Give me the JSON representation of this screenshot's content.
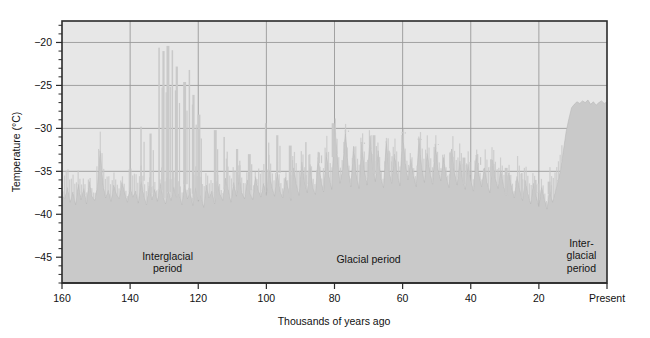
{
  "figure": {
    "background_color": "#ffffff",
    "plot_background_color": "#e7e7e7",
    "series_color": "#c9c9c9",
    "grid_color": "#9a9a9a",
    "frame_color": "#2b2b2b"
  },
  "chart_data": {
    "type": "area",
    "title": "",
    "subtitle": "",
    "xlabel": "Thousands of years ago",
    "ylabel": "Temperature (°C)",
    "xlim": [
      160,
      0
    ],
    "ylim": [
      -48,
      -17.5
    ],
    "x_reversed": true,
    "grid": true,
    "legend": "none",
    "x_tick_values": [
      160,
      140,
      120,
      100,
      80,
      60,
      40,
      20,
      0
    ],
    "x_tick_labels": [
      "160",
      "140",
      "120",
      "100",
      "80",
      "60",
      "40",
      "20",
      "Present"
    ],
    "x_minor_tick_step": 5,
    "y_tick_values": [
      -20,
      -25,
      -30,
      -35,
      -40,
      -45
    ],
    "y_tick_labels": [
      "−20",
      "−25",
      "−30",
      "−35",
      "−40",
      "−45"
    ],
    "y_minor_tick_step": 1,
    "annotations": [
      {
        "name": "interglacial-left",
        "lines": [
          "Interglacial",
          "period"
        ],
        "x": 129,
        "y": -45.3
      },
      {
        "name": "glacial-middle",
        "lines": [
          "Glacial period"
        ],
        "x": 70,
        "y": -45.7
      },
      {
        "name": "interglacial-right",
        "lines": [
          "Inter-",
          "glacial",
          "period"
        ],
        "x": 7.5,
        "y": -43.8
      }
    ],
    "series": [
      {
        "name": "Ice-core temperature reconstruction",
        "units": "°C",
        "x": [
          160.0,
          159.2,
          158.4,
          157.6,
          156.8,
          156.0,
          155.2,
          154.4,
          153.6,
          152.8,
          152.0,
          151.2,
          150.4,
          149.6,
          148.8,
          148.0,
          147.2,
          146.4,
          145.6,
          144.8,
          144.0,
          143.2,
          142.4,
          141.6,
          140.8,
          140.0,
          139.2,
          138.4,
          137.6,
          136.8,
          136.0,
          135.2,
          134.4,
          133.6,
          132.8,
          132.0,
          131.2,
          130.4,
          129.6,
          128.8,
          128.0,
          127.2,
          126.4,
          125.6,
          124.8,
          124.0,
          123.2,
          122.4,
          121.6,
          120.8,
          120.0,
          119.2,
          118.4,
          117.6,
          116.8,
          116.0,
          115.2,
          114.4,
          113.6,
          112.8,
          112.0,
          111.2,
          110.4,
          109.6,
          108.8,
          108.0,
          107.2,
          106.4,
          105.6,
          104.8,
          104.0,
          103.2,
          102.4,
          101.6,
          100.8,
          100.0,
          99.2,
          98.4,
          97.6,
          96.8,
          96.0,
          95.2,
          94.4,
          93.6,
          92.8,
          92.0,
          91.2,
          90.4,
          89.6,
          88.8,
          88.0,
          87.2,
          86.4,
          85.6,
          84.8,
          84.0,
          83.2,
          82.4,
          81.6,
          80.8,
          80.0,
          79.2,
          78.4,
          77.6,
          76.8,
          76.0,
          75.2,
          74.4,
          73.6,
          72.8,
          72.0,
          71.2,
          70.4,
          69.6,
          68.8,
          68.0,
          67.2,
          66.4,
          65.6,
          64.8,
          64.0,
          63.2,
          62.4,
          61.6,
          60.8,
          60.0,
          59.2,
          58.4,
          57.6,
          56.8,
          56.0,
          55.2,
          54.4,
          53.6,
          52.8,
          52.0,
          51.2,
          50.4,
          49.6,
          48.8,
          48.0,
          47.2,
          46.4,
          45.6,
          44.8,
          44.0,
          43.2,
          42.4,
          41.6,
          40.8,
          40.0,
          39.2,
          38.4,
          37.6,
          36.8,
          36.0,
          35.2,
          34.4,
          33.6,
          32.8,
          32.0,
          31.2,
          30.4,
          29.6,
          28.8,
          28.0,
          27.2,
          26.4,
          25.6,
          24.8,
          24.0,
          23.2,
          22.4,
          21.6,
          20.8,
          20.0,
          19.2,
          18.4,
          17.6,
          16.8,
          16.0,
          15.2,
          14.4,
          13.6,
          12.8,
          12.0,
          11.2,
          10.4,
          9.6,
          8.8,
          8.0,
          7.2,
          6.4,
          5.6,
          4.8,
          4.0,
          3.2,
          2.4,
          1.6,
          0.8,
          0.0
        ],
        "y": [
          -37.8,
          -38.2,
          -36.9,
          -38.6,
          -37.4,
          -38.9,
          -36.5,
          -38.3,
          -37.0,
          -38.8,
          -36.2,
          -37.9,
          -38.4,
          -36.8,
          -32.6,
          -36.4,
          -38.1,
          -37.2,
          -38.5,
          -36.6,
          -37.7,
          -38.2,
          -36.3,
          -37.5,
          -38.6,
          -36.9,
          -38.0,
          -37.3,
          -38.7,
          -36.1,
          -37.8,
          -38.9,
          -36.7,
          -38.3,
          -37.1,
          -38.5,
          -36.4,
          -37.9,
          -38.8,
          -37.2,
          -38.4,
          -36.8,
          -38.0,
          -37.6,
          -38.9,
          -36.5,
          -38.2,
          -37.4,
          -39.0,
          -36.9,
          -38.5,
          -37.8,
          -39.2,
          -36.6,
          -38.1,
          -37.3,
          -38.8,
          -36.2,
          -37.7,
          -38.4,
          -35.8,
          -37.1,
          -38.6,
          -36.3,
          -37.9,
          -35.4,
          -37.5,
          -38.2,
          -36.0,
          -37.6,
          -38.3,
          -35.6,
          -37.2,
          -38.0,
          -36.4,
          -37.8,
          -34.9,
          -36.8,
          -37.9,
          -35.2,
          -37.3,
          -38.1,
          -35.7,
          -37.0,
          -38.4,
          -34.6,
          -36.5,
          -37.8,
          -33.9,
          -36.2,
          -37.5,
          -34.2,
          -36.9,
          -37.7,
          -33.4,
          -36.0,
          -37.4,
          -32.8,
          -35.6,
          -37.1,
          -29.6,
          -33.2,
          -36.4,
          -34.8,
          -30.4,
          -34.6,
          -36.8,
          -32.1,
          -35.4,
          -37.0,
          -31.8,
          -35.0,
          -36.6,
          -30.9,
          -34.4,
          -36.2,
          -32.6,
          -35.8,
          -36.9,
          -31.5,
          -34.9,
          -36.4,
          -33.0,
          -35.2,
          -36.7,
          -30.6,
          -34.1,
          -36.0,
          -33.6,
          -35.5,
          -36.8,
          -31.2,
          -34.6,
          -36.3,
          -32.9,
          -35.0,
          -36.5,
          -31.9,
          -34.8,
          -36.1,
          -33.4,
          -35.6,
          -36.9,
          -32.4,
          -35.1,
          -36.6,
          -33.8,
          -35.9,
          -37.1,
          -34.2,
          -36.0,
          -37.3,
          -33.1,
          -35.4,
          -36.8,
          -34.6,
          -36.3,
          -37.5,
          -33.7,
          -35.8,
          -37.0,
          -34.9,
          -36.6,
          -37.8,
          -35.2,
          -36.9,
          -38.1,
          -35.6,
          -37.2,
          -38.4,
          -36.1,
          -37.6,
          -38.8,
          -36.4,
          -37.9,
          -39.1,
          -36.8,
          -38.2,
          -39.4,
          -37.1,
          -38.6,
          -37.4,
          -36.2,
          -34.8,
          -32.6,
          -30.4,
          -28.9,
          -27.6,
          -27.2,
          -26.9,
          -27.1,
          -26.8,
          -27.0,
          -26.7,
          -27.2,
          -26.9,
          -27.3,
          -27.0,
          -26.8,
          -27.1,
          -26.9
        ],
        "peaks": [
          {
            "x": 131.5,
            "y": -20.6
          },
          {
            "x": 130.2,
            "y": -21.0
          },
          {
            "x": 128.9,
            "y": -20.4
          },
          {
            "x": 127.6,
            "y": -20.9
          },
          {
            "x": 126.3,
            "y": -22.8
          },
          {
            "x": 124.0,
            "y": -24.6
          },
          {
            "x": 122.6,
            "y": -23.2
          },
          {
            "x": 121.4,
            "y": -26.1
          },
          {
            "x": 119.8,
            "y": -28.4
          },
          {
            "x": 136.8,
            "y": -29.8
          },
          {
            "x": 134.0,
            "y": -30.6
          },
          {
            "x": 115.0,
            "y": -30.2
          },
          {
            "x": 112.4,
            "y": -31.0
          },
          {
            "x": 108.6,
            "y": -32.4
          },
          {
            "x": 105.0,
            "y": -33.0
          },
          {
            "x": 100.2,
            "y": -29.4
          },
          {
            "x": 96.8,
            "y": -30.8
          },
          {
            "x": 93.0,
            "y": -32.0
          },
          {
            "x": 88.4,
            "y": -31.6
          },
          {
            "x": 84.6,
            "y": -32.8
          },
          {
            "x": 80.4,
            "y": -29.4
          },
          {
            "x": 76.8,
            "y": -30.2
          },
          {
            "x": 72.0,
            "y": -31.6
          },
          {
            "x": 68.4,
            "y": -30.8
          },
          {
            "x": 64.0,
            "y": -32.6
          },
          {
            "x": 60.0,
            "y": -30.4
          },
          {
            "x": 55.2,
            "y": -31.2
          },
          {
            "x": 50.4,
            "y": -31.8
          },
          {
            "x": 46.0,
            "y": -32.8
          },
          {
            "x": 42.0,
            "y": -33.4
          },
          {
            "x": 38.0,
            "y": -33.0
          },
          {
            "x": 34.0,
            "y": -33.6
          },
          {
            "x": 29.6,
            "y": -34.6
          },
          {
            "x": 25.0,
            "y": -35.2
          },
          {
            "x": 21.0,
            "y": -36.0
          },
          {
            "x": 17.0,
            "y": -36.2
          },
          {
            "x": 14.4,
            "y": -36.0
          }
        ]
      }
    ]
  }
}
